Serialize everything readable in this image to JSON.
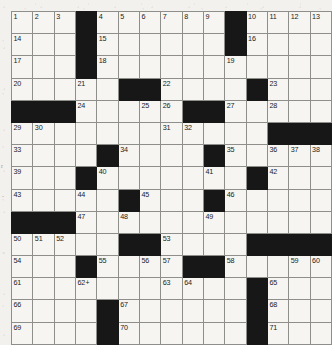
{
  "page": {
    "kind": "crossword-puzzle-grid",
    "rows": 15,
    "cols": 15,
    "ink_color": "#171717",
    "cell_color": "#f6f5f2",
    "grid_line_color": "#8e8e8a"
  },
  "grid": {
    "rows": [
      [
        {
          "type": "white",
          "number": "1"
        },
        {
          "type": "white",
          "number": "2"
        },
        {
          "type": "white",
          "number": "3"
        },
        {
          "type": "block"
        },
        {
          "type": "white",
          "number": "4"
        },
        {
          "type": "white",
          "number": "5"
        },
        {
          "type": "white",
          "number": "6"
        },
        {
          "type": "white",
          "number": "7"
        },
        {
          "type": "white",
          "number": "8"
        },
        {
          "type": "white",
          "number": "9"
        },
        {
          "type": "block"
        },
        {
          "type": "white",
          "number": "10"
        },
        {
          "type": "white",
          "number": "11"
        },
        {
          "type": "white",
          "number": "12"
        },
        {
          "type": "white",
          "number": "13"
        }
      ],
      [
        {
          "type": "white",
          "number": "14"
        },
        {
          "type": "white"
        },
        {
          "type": "white"
        },
        {
          "type": "block"
        },
        {
          "type": "white",
          "number": "15"
        },
        {
          "type": "white"
        },
        {
          "type": "white"
        },
        {
          "type": "white"
        },
        {
          "type": "white"
        },
        {
          "type": "white"
        },
        {
          "type": "block"
        },
        {
          "type": "white",
          "number": "16"
        },
        {
          "type": "white"
        },
        {
          "type": "white"
        },
        {
          "type": "white"
        }
      ],
      [
        {
          "type": "white",
          "number": "17"
        },
        {
          "type": "white"
        },
        {
          "type": "white"
        },
        {
          "type": "block"
        },
        {
          "type": "white",
          "number": "18"
        },
        {
          "type": "white"
        },
        {
          "type": "white"
        },
        {
          "type": "white"
        },
        {
          "type": "white"
        },
        {
          "type": "white"
        },
        {
          "type": "white",
          "number": "19"
        },
        {
          "type": "white"
        },
        {
          "type": "white"
        },
        {
          "type": "white"
        },
        {
          "type": "white"
        }
      ],
      [
        {
          "type": "white",
          "number": "20"
        },
        {
          "type": "white"
        },
        {
          "type": "white"
        },
        {
          "type": "white",
          "number": "21"
        },
        {
          "type": "white"
        },
        {
          "type": "block"
        },
        {
          "type": "block"
        },
        {
          "type": "white",
          "number": "22"
        },
        {
          "type": "white"
        },
        {
          "type": "white"
        },
        {
          "type": "white"
        },
        {
          "type": "block"
        },
        {
          "type": "white",
          "number": "23"
        },
        {
          "type": "white"
        },
        {
          "type": "white"
        }
      ],
      [
        {
          "type": "block"
        },
        {
          "type": "block"
        },
        {
          "type": "block"
        },
        {
          "type": "white",
          "number": "24"
        },
        {
          "type": "white"
        },
        {
          "type": "white"
        },
        {
          "type": "white",
          "number": "25"
        },
        {
          "type": "white",
          "number": "26"
        },
        {
          "type": "block"
        },
        {
          "type": "block"
        },
        {
          "type": "white",
          "number": "27"
        },
        {
          "type": "white"
        },
        {
          "type": "white",
          "number": "28"
        },
        {
          "type": "white"
        },
        {
          "type": "white"
        }
      ],
      [
        {
          "type": "white",
          "number": "29"
        },
        {
          "type": "white",
          "number": "30"
        },
        {
          "type": "white"
        },
        {
          "type": "white"
        },
        {
          "type": "white"
        },
        {
          "type": "white"
        },
        {
          "type": "white"
        },
        {
          "type": "white",
          "number": "31"
        },
        {
          "type": "white",
          "number": "32"
        },
        {
          "type": "white"
        },
        {
          "type": "white"
        },
        {
          "type": "white"
        },
        {
          "type": "block"
        },
        {
          "type": "block"
        },
        {
          "type": "block"
        }
      ],
      [
        {
          "type": "white",
          "number": "33"
        },
        {
          "type": "white"
        },
        {
          "type": "white"
        },
        {
          "type": "white"
        },
        {
          "type": "block"
        },
        {
          "type": "white",
          "number": "34"
        },
        {
          "type": "white"
        },
        {
          "type": "white"
        },
        {
          "type": "white"
        },
        {
          "type": "block"
        },
        {
          "type": "white",
          "number": "35"
        },
        {
          "type": "white"
        },
        {
          "type": "white",
          "number": "36"
        },
        {
          "type": "white",
          "number": "37"
        },
        {
          "type": "white",
          "number": "38"
        }
      ],
      [
        {
          "type": "white",
          "number": "39"
        },
        {
          "type": "white"
        },
        {
          "type": "white"
        },
        {
          "type": "block"
        },
        {
          "type": "white",
          "number": "40"
        },
        {
          "type": "white"
        },
        {
          "type": "white"
        },
        {
          "type": "white"
        },
        {
          "type": "white"
        },
        {
          "type": "white",
          "number": "41"
        },
        {
          "type": "white"
        },
        {
          "type": "block"
        },
        {
          "type": "white",
          "number": "42"
        },
        {
          "type": "white"
        },
        {
          "type": "white"
        }
      ],
      [
        {
          "type": "white",
          "number": "43"
        },
        {
          "type": "white"
        },
        {
          "type": "white"
        },
        {
          "type": "white",
          "number": "44"
        },
        {
          "type": "white"
        },
        {
          "type": "block"
        },
        {
          "type": "white",
          "number": "45"
        },
        {
          "type": "white"
        },
        {
          "type": "white"
        },
        {
          "type": "block"
        },
        {
          "type": "white",
          "number": "46"
        },
        {
          "type": "white"
        },
        {
          "type": "white"
        },
        {
          "type": "white"
        },
        {
          "type": "white"
        }
      ],
      [
        {
          "type": "block"
        },
        {
          "type": "block"
        },
        {
          "type": "block"
        },
        {
          "type": "white",
          "number": "47"
        },
        {
          "type": "white"
        },
        {
          "type": "white",
          "number": "48"
        },
        {
          "type": "white"
        },
        {
          "type": "white"
        },
        {
          "type": "white"
        },
        {
          "type": "white",
          "number": "49"
        },
        {
          "type": "white"
        },
        {
          "type": "white"
        },
        {
          "type": "white"
        },
        {
          "type": "white"
        },
        {
          "type": "white"
        }
      ],
      [
        {
          "type": "white",
          "number": "50"
        },
        {
          "type": "white",
          "number": "51"
        },
        {
          "type": "white",
          "number": "52"
        },
        {
          "type": "white"
        },
        {
          "type": "white"
        },
        {
          "type": "block"
        },
        {
          "type": "block"
        },
        {
          "type": "white",
          "number": "53"
        },
        {
          "type": "white"
        },
        {
          "type": "white"
        },
        {
          "type": "white"
        },
        {
          "type": "block"
        },
        {
          "type": "block"
        },
        {
          "type": "block"
        },
        {
          "type": "block"
        }
      ],
      [
        {
          "type": "white",
          "number": "54"
        },
        {
          "type": "white"
        },
        {
          "type": "white"
        },
        {
          "type": "block"
        },
        {
          "type": "white",
          "number": "55"
        },
        {
          "type": "white"
        },
        {
          "type": "white",
          "number": "56"
        },
        {
          "type": "white",
          "number": "57"
        },
        {
          "type": "block"
        },
        {
          "type": "block"
        },
        {
          "type": "white",
          "number": "58"
        },
        {
          "type": "white"
        },
        {
          "type": "white"
        },
        {
          "type": "white",
          "number": "59"
        },
        {
          "type": "white",
          "number": "60"
        }
      ],
      [
        {
          "type": "white",
          "number": "61"
        },
        {
          "type": "white"
        },
        {
          "type": "white"
        },
        {
          "type": "white",
          "number": "62",
          "mark": "+"
        },
        {
          "type": "white"
        },
        {
          "type": "white"
        },
        {
          "type": "white"
        },
        {
          "type": "white",
          "number": "63"
        },
        {
          "type": "white",
          "number": "64"
        },
        {
          "type": "white"
        },
        {
          "type": "white"
        },
        {
          "type": "block"
        },
        {
          "type": "white",
          "number": "65"
        },
        {
          "type": "white"
        },
        {
          "type": "white"
        }
      ],
      [
        {
          "type": "white",
          "number": "66"
        },
        {
          "type": "white"
        },
        {
          "type": "white"
        },
        {
          "type": "white"
        },
        {
          "type": "block"
        },
        {
          "type": "white",
          "number": "67"
        },
        {
          "type": "white"
        },
        {
          "type": "white"
        },
        {
          "type": "white"
        },
        {
          "type": "white"
        },
        {
          "type": "white"
        },
        {
          "type": "block"
        },
        {
          "type": "white",
          "number": "68"
        },
        {
          "type": "white"
        },
        {
          "type": "white"
        }
      ],
      [
        {
          "type": "white",
          "number": "69"
        },
        {
          "type": "white"
        },
        {
          "type": "white"
        },
        {
          "type": "white"
        },
        {
          "type": "block"
        },
        {
          "type": "white",
          "number": "70"
        },
        {
          "type": "white"
        },
        {
          "type": "white"
        },
        {
          "type": "white"
        },
        {
          "type": "white"
        },
        {
          "type": "white"
        },
        {
          "type": "block"
        },
        {
          "type": "white",
          "number": "71"
        },
        {
          "type": "white"
        },
        {
          "type": "white"
        }
      ]
    ]
  },
  "margin_marks": [
    {
      "text": "r",
      "left": 1,
      "top": 163
    },
    {
      "text": "-",
      "left": 2,
      "top": 193
    }
  ]
}
